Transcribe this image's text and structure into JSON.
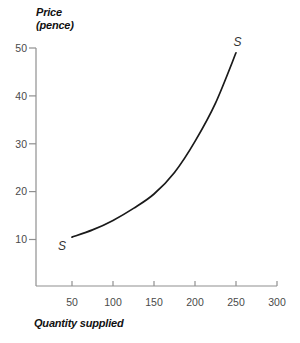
{
  "chart_data": {
    "type": "line",
    "title": "",
    "xlabel": "Quantity supplied",
    "ylabel": "Price (pence)",
    "ylabel_display": "Price\n(pence)",
    "xlim": [
      0,
      300
    ],
    "ylim": [
      0,
      50
    ],
    "x_ticks": [
      50,
      100,
      150,
      200,
      250,
      300
    ],
    "y_ticks": [
      10,
      20,
      30,
      40,
      50
    ],
    "grid": false,
    "legend": "none",
    "axis_color": "#8f8f8f",
    "tick_label_color": "#4a4a4a",
    "series": [
      {
        "name": "S",
        "description": "Upward-sloping supply curve from (50,10) to (250,49)",
        "color": "#1a1a1a",
        "points": [
          [
            50,
            10.5
          ],
          [
            75,
            12
          ],
          [
            100,
            14
          ],
          [
            125,
            16.5
          ],
          [
            150,
            19.5
          ],
          [
            175,
            24
          ],
          [
            200,
            30.5
          ],
          [
            225,
            38.5
          ],
          [
            250,
            49
          ]
        ],
        "end_labels": [
          {
            "text": "S",
            "q": 37.8,
            "p": 8.6
          },
          {
            "text": "S",
            "q": 252,
            "p": 51.3
          }
        ]
      }
    ]
  }
}
